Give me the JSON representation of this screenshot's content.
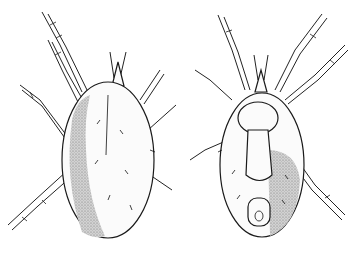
{
  "figure": {
    "background": "#ffffff",
    "ink": "#1a1a1a",
    "views": [
      {
        "name": "dorsal",
        "center_x": 98,
        "center_y": 150
      },
      {
        "name": "ventral",
        "center_x": 260,
        "center_y": 150
      }
    ]
  }
}
